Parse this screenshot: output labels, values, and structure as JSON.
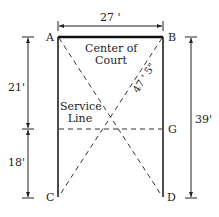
{
  "diagram": {
    "width_label": "27 '",
    "left_top_label": "21'",
    "left_bottom_label": "18'",
    "right_label": "39'",
    "diagonal_label": "47 ' 5\"",
    "points": {
      "A": "A",
      "B": "B",
      "C": "C",
      "D": "D",
      "G": "G"
    },
    "center_label_line1": "Center of",
    "center_label_line2": "Court",
    "service_label_line1": "Service",
    "service_label_line2": "Line"
  }
}
